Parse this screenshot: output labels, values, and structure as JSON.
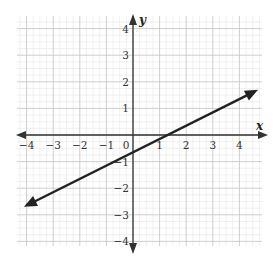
{
  "chart_data": {
    "type": "line",
    "title": "",
    "xlabel": "x",
    "ylabel": "y",
    "xlim": [
      -4,
      4
    ],
    "ylim": [
      -4,
      4
    ],
    "grid": true,
    "minor_grid_per_unit": 4,
    "x_ticks": [
      "-4",
      "-3",
      "-2",
      "-1",
      "0",
      "1",
      "2",
      "3",
      "4"
    ],
    "y_ticks": [
      "4",
      "3",
      "2",
      "1",
      "-1",
      "-2",
      "-3",
      "-4"
    ],
    "series": [
      {
        "name": "line",
        "equation": "y = 0.5x - 0.65",
        "slope": 0.5,
        "intercept": -0.65,
        "points": [
          {
            "x": -4.1,
            "y": -2.7
          },
          {
            "x": 4.7,
            "y": 1.7
          }
        ],
        "arrows": "both",
        "color": "#222222"
      }
    ],
    "legend": null
  },
  "colors": {
    "grid_major": "#c8c8c8",
    "grid_minor": "#e6e6e6",
    "axis": "#333333",
    "line": "#222222"
  }
}
